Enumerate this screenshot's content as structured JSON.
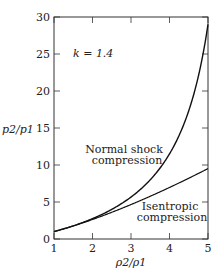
{
  "chart_data": {
    "type": "line",
    "title": "",
    "xlabel": "ρ2/ρ1",
    "ylabel": "p2/p1",
    "xlim": [
      1,
      5
    ],
    "ylim": [
      0,
      30
    ],
    "xticks": [
      1,
      2,
      3,
      4,
      5
    ],
    "yticks": [
      0,
      5,
      10,
      15,
      20,
      25,
      30
    ],
    "grid": false,
    "annotation": "k = 1.4",
    "series": [
      {
        "name": "Normal shock compression",
        "label_lines": [
          "Normal shock",
          "compression"
        ],
        "x": [
          1.0,
          1.5,
          2.0,
          2.5,
          3.0,
          3.5,
          4.0,
          4.5,
          5.0
        ],
        "y": [
          1.0,
          1.8,
          2.75,
          3.9,
          5.4,
          7.33,
          10.0,
          14.0,
          29.0
        ]
      },
      {
        "name": "Isentropic compression",
        "label_lines": [
          "Isentropic",
          "compression"
        ],
        "x": [
          1.0,
          1.5,
          2.0,
          2.5,
          3.0,
          3.5,
          4.0,
          4.5,
          5.0
        ],
        "y": [
          1.0,
          1.76,
          2.64,
          3.61,
          4.66,
          5.78,
          6.96,
          8.22,
          9.52
        ]
      }
    ]
  }
}
